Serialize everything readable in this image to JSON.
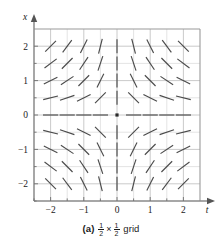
{
  "caption": {
    "label": "(a)",
    "numerator_1": "1",
    "denominator_1": "2",
    "times": "×",
    "numerator_2": "1",
    "denominator_2": "2",
    "text": "grid"
  },
  "chart_data": {
    "type": "scatter",
    "subtype": "slope-field",
    "title": "",
    "xlabel": "t",
    "ylabel": "x",
    "xlim": [
      -2.5,
      2.5
    ],
    "ylim": [
      -2.5,
      2.5
    ],
    "xticks": [
      -2,
      -1,
      0,
      1,
      2
    ],
    "xticklabels": [
      "−2",
      "−1",
      "0",
      "1",
      "2"
    ],
    "yticks": [
      -2,
      -1,
      0,
      1,
      2
    ],
    "yticklabels": [
      "−2",
      "−1",
      "0",
      "1",
      "2"
    ],
    "minor_tick_step": 0.5,
    "grid": true,
    "grid_step": 0.5,
    "legend": null,
    "origin_marker": {
      "t": 0,
      "x": 0,
      "style": "filled-dot"
    },
    "grid_points_step": 0.5,
    "grid_points_range": [
      -2,
      2
    ],
    "slope_rule": "dx/dt = -x/t",
    "colors": {
      "segment": "#4a4a4a",
      "grid": "#d8d8d8",
      "axis": "#8a8a8a",
      "frame": "#9a9a9a",
      "text": "#1a1a1a"
    },
    "segments": [
      {
        "t": -2.0,
        "x": 2.0,
        "slope": 1.0
      },
      {
        "t": -1.5,
        "x": 2.0,
        "slope": 1.3333
      },
      {
        "t": -1.0,
        "x": 2.0,
        "slope": 2.0
      },
      {
        "t": -0.5,
        "x": 2.0,
        "slope": 4.0
      },
      {
        "t": 0.0,
        "x": 2.0,
        "slope": null
      },
      {
        "t": 0.5,
        "x": 2.0,
        "slope": -4.0
      },
      {
        "t": 1.0,
        "x": 2.0,
        "slope": -2.0
      },
      {
        "t": 1.5,
        "x": 2.0,
        "slope": -1.3333
      },
      {
        "t": 2.0,
        "x": 2.0,
        "slope": -1.0
      },
      {
        "t": -2.0,
        "x": 1.5,
        "slope": 0.75
      },
      {
        "t": -1.5,
        "x": 1.5,
        "slope": 1.0
      },
      {
        "t": -1.0,
        "x": 1.5,
        "slope": 1.5
      },
      {
        "t": -0.5,
        "x": 1.5,
        "slope": 3.0
      },
      {
        "t": 0.0,
        "x": 1.5,
        "slope": null
      },
      {
        "t": 0.5,
        "x": 1.5,
        "slope": -3.0
      },
      {
        "t": 1.0,
        "x": 1.5,
        "slope": -1.5
      },
      {
        "t": 1.5,
        "x": 1.5,
        "slope": -1.0
      },
      {
        "t": 2.0,
        "x": 1.5,
        "slope": -0.75
      },
      {
        "t": -2.0,
        "x": 1.0,
        "slope": 0.5
      },
      {
        "t": -1.5,
        "x": 1.0,
        "slope": 0.6667
      },
      {
        "t": -1.0,
        "x": 1.0,
        "slope": 1.0
      },
      {
        "t": -0.5,
        "x": 1.0,
        "slope": 2.0
      },
      {
        "t": 0.0,
        "x": 1.0,
        "slope": null
      },
      {
        "t": 0.5,
        "x": 1.0,
        "slope": -2.0
      },
      {
        "t": 1.0,
        "x": 1.0,
        "slope": -1.0
      },
      {
        "t": 1.5,
        "x": 1.0,
        "slope": -0.6667
      },
      {
        "t": 2.0,
        "x": 1.0,
        "slope": -0.5
      },
      {
        "t": -2.0,
        "x": 0.5,
        "slope": 0.25
      },
      {
        "t": -1.5,
        "x": 0.5,
        "slope": 0.3333
      },
      {
        "t": -1.0,
        "x": 0.5,
        "slope": 0.5
      },
      {
        "t": -0.5,
        "x": 0.5,
        "slope": 1.0
      },
      {
        "t": 0.0,
        "x": 0.5,
        "slope": null
      },
      {
        "t": 0.5,
        "x": 0.5,
        "slope": -1.0
      },
      {
        "t": 1.0,
        "x": 0.5,
        "slope": -0.5
      },
      {
        "t": 1.5,
        "x": 0.5,
        "slope": -0.3333
      },
      {
        "t": 2.0,
        "x": 0.5,
        "slope": -0.25
      },
      {
        "t": -2.0,
        "x": 0.0,
        "slope": 0.0
      },
      {
        "t": -1.5,
        "x": 0.0,
        "slope": 0.0
      },
      {
        "t": -1.0,
        "x": 0.0,
        "slope": 0.0
      },
      {
        "t": -0.5,
        "x": 0.0,
        "slope": 0.0
      },
      {
        "t": 0.5,
        "x": 0.0,
        "slope": 0.0
      },
      {
        "t": 1.0,
        "x": 0.0,
        "slope": 0.0
      },
      {
        "t": 1.5,
        "x": 0.0,
        "slope": 0.0
      },
      {
        "t": 2.0,
        "x": 0.0,
        "slope": 0.0
      },
      {
        "t": -2.0,
        "x": -0.5,
        "slope": -0.25
      },
      {
        "t": -1.5,
        "x": -0.5,
        "slope": -0.3333
      },
      {
        "t": -1.0,
        "x": -0.5,
        "slope": -0.5
      },
      {
        "t": -0.5,
        "x": -0.5,
        "slope": -1.0
      },
      {
        "t": 0.0,
        "x": -0.5,
        "slope": null
      },
      {
        "t": 0.5,
        "x": -0.5,
        "slope": 1.0
      },
      {
        "t": 1.0,
        "x": -0.5,
        "slope": 0.5
      },
      {
        "t": 1.5,
        "x": -0.5,
        "slope": 0.3333
      },
      {
        "t": 2.0,
        "x": -0.5,
        "slope": 0.25
      },
      {
        "t": -2.0,
        "x": -1.0,
        "slope": -0.5
      },
      {
        "t": -1.5,
        "x": -1.0,
        "slope": -0.6667
      },
      {
        "t": -1.0,
        "x": -1.0,
        "slope": -1.0
      },
      {
        "t": -0.5,
        "x": -1.0,
        "slope": -2.0
      },
      {
        "t": 0.0,
        "x": -1.0,
        "slope": null
      },
      {
        "t": 0.5,
        "x": -1.0,
        "slope": 2.0
      },
      {
        "t": 1.0,
        "x": -1.0,
        "slope": 1.0
      },
      {
        "t": 1.5,
        "x": -1.0,
        "slope": 0.6667
      },
      {
        "t": 2.0,
        "x": -1.0,
        "slope": 0.5
      },
      {
        "t": -2.0,
        "x": -1.5,
        "slope": -0.75
      },
      {
        "t": -1.5,
        "x": -1.5,
        "slope": -1.0
      },
      {
        "t": -1.0,
        "x": -1.5,
        "slope": -1.5
      },
      {
        "t": -0.5,
        "x": -1.5,
        "slope": -3.0
      },
      {
        "t": 0.0,
        "x": -1.5,
        "slope": null
      },
      {
        "t": 0.5,
        "x": -1.5,
        "slope": 3.0
      },
      {
        "t": 1.0,
        "x": -1.5,
        "slope": 1.5
      },
      {
        "t": 1.5,
        "x": -1.5,
        "slope": 1.0
      },
      {
        "t": 2.0,
        "x": -1.5,
        "slope": 0.75
      },
      {
        "t": -2.0,
        "x": -2.0,
        "slope": -1.0
      },
      {
        "t": -1.5,
        "x": -2.0,
        "slope": -1.3333
      },
      {
        "t": -1.0,
        "x": -2.0,
        "slope": -2.0
      },
      {
        "t": -0.5,
        "x": -2.0,
        "slope": -4.0
      },
      {
        "t": 0.0,
        "x": -2.0,
        "slope": null
      },
      {
        "t": 0.5,
        "x": -2.0,
        "slope": 4.0
      },
      {
        "t": 1.0,
        "x": -2.0,
        "slope": 2.0
      },
      {
        "t": 1.5,
        "x": -2.0,
        "slope": 1.3333
      },
      {
        "t": 2.0,
        "x": -2.0,
        "slope": 1.0
      }
    ]
  }
}
